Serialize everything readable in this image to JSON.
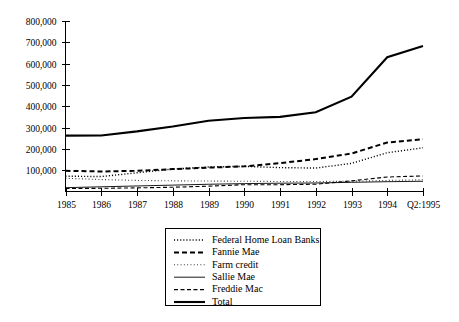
{
  "chart_data": {
    "type": "line",
    "title": "",
    "xlabel": "",
    "ylabel": "",
    "grid": false,
    "legend_position": "bottom-center",
    "categories": [
      "1985",
      "1986",
      "1987",
      "1988",
      "1989",
      "1990",
      "1991",
      "1992",
      "1993",
      "1994",
      "Q2:1995"
    ],
    "x": [
      1985,
      1986,
      1987,
      1988,
      1989,
      1990,
      1991,
      1992,
      1993,
      1994,
      1995.5
    ],
    "ylim": [
      0,
      800000
    ],
    "yticks": [
      100000,
      200000,
      300000,
      400000,
      500000,
      600000,
      700000,
      800000
    ],
    "ytick_labels": [
      "100,000",
      "200,000",
      "300,000",
      "400,000",
      "500,000",
      "600,000",
      "700,000",
      "800,000"
    ],
    "series": [
      {
        "name": "Federal Home Loan Banks",
        "style": "fine-dotted",
        "values": [
          72000,
          70000,
          88000,
          105000,
          115000,
          118000,
          112000,
          110000,
          132000,
          182000,
          205000
        ]
      },
      {
        "name": "Fannie Mae",
        "style": "bold-dashed",
        "values": [
          97000,
          94000,
          97000,
          105000,
          112000,
          118000,
          133000,
          152000,
          178000,
          230000,
          245000
        ]
      },
      {
        "name": "Farm credit",
        "style": "light-dotted",
        "values": [
          62000,
          56000,
          52000,
          50000,
          49000,
          48000,
          47000,
          47000,
          48000,
          52000,
          55000
        ]
      },
      {
        "name": "Sallie Mae",
        "style": "thin-solid",
        "values": [
          18000,
          22000,
          26000,
          30000,
          34000,
          37000,
          39000,
          40000,
          43000,
          46000,
          48000
        ]
      },
      {
        "name": "Freddie Mac",
        "style": "thin-dashed",
        "values": [
          14000,
          15000,
          17000,
          20000,
          25000,
          32000,
          32000,
          34000,
          50000,
          68000,
          73000
        ]
      },
      {
        "name": "Total",
        "style": "bold-solid",
        "values": [
          262000,
          263000,
          282000,
          305000,
          332000,
          345000,
          350000,
          372000,
          445000,
          630000,
          683000
        ]
      }
    ]
  },
  "legend": {
    "entries": [
      {
        "label": "Federal Home Loan Banks"
      },
      {
        "label": "Fannie Mae"
      },
      {
        "label": "Farm credit"
      },
      {
        "label": "Sallie Mae"
      },
      {
        "label": "Freddie Mac"
      },
      {
        "label": "Total"
      }
    ]
  },
  "colors": {
    "ink": "#000000",
    "background": "#ffffff"
  }
}
